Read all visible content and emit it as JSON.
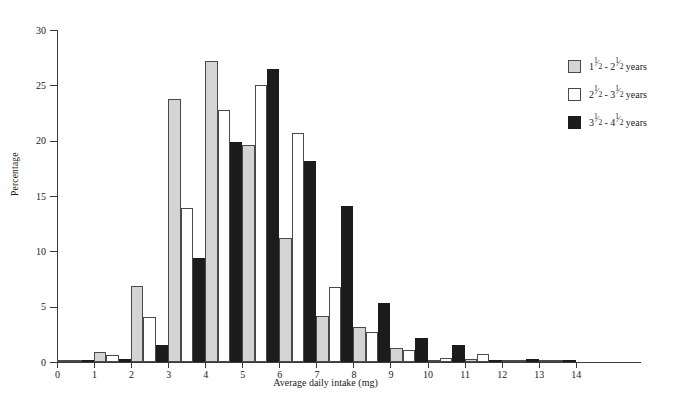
{
  "chart_data": {
    "type": "bar",
    "title": "",
    "xlabel": "Average daily intake (mg)",
    "ylabel": "Percentage",
    "xlim": [
      0,
      14.6
    ],
    "ylim": [
      0,
      30
    ],
    "xticks": [
      0,
      1,
      2,
      3,
      4,
      5,
      6,
      7,
      8,
      9,
      10,
      11,
      12,
      13,
      14
    ],
    "yticks": [
      0,
      5,
      10,
      15,
      20,
      25,
      30
    ],
    "grid": false,
    "legend_position": "right",
    "bin_width": 1,
    "categories": [
      0.5,
      1.5,
      2.5,
      3.5,
      4.5,
      5.5,
      6.5,
      7.5,
      8.5,
      9.5,
      10.5,
      11.5,
      12.5,
      13.5
    ],
    "series": [
      {
        "name": "1½ - 2½ years",
        "color": "#d4d4d4",
        "legend": {
          "n1": "1",
          "num1": "1",
          "den1": "2",
          "n2": "2",
          "num2": "1",
          "den2": "2",
          "unit": "years"
        },
        "values": [
          0.2,
          0.9,
          6.9,
          23.8,
          27.2,
          19.6,
          11.2,
          4.2,
          3.2,
          1.3,
          0.2,
          0.3,
          0.2,
          0.2
        ]
      },
      {
        "name": "2½ - 3½ years",
        "color": "#ffffff",
        "legend": {
          "n1": "2",
          "num1": "1",
          "den1": "2",
          "n2": "3",
          "num2": "1",
          "den2": "2",
          "unit": "years"
        },
        "values": [
          0.2,
          0.6,
          4.1,
          13.9,
          22.8,
          25.0,
          20.7,
          6.8,
          2.7,
          1.1,
          0.4,
          0.7,
          0.2,
          0.2
        ]
      },
      {
        "name": "3½ - 4½ years",
        "color": "#1c1c1c",
        "legend": {
          "n1": "3",
          "num1": "1",
          "den1": "2",
          "n2": "4",
          "num2": "1",
          "den2": "2",
          "unit": "years"
        },
        "values": [
          0.1,
          0.3,
          1.5,
          9.4,
          19.9,
          26.5,
          18.2,
          14.1,
          5.3,
          2.2,
          1.5,
          0.2,
          0.3,
          0.1
        ]
      }
    ]
  }
}
